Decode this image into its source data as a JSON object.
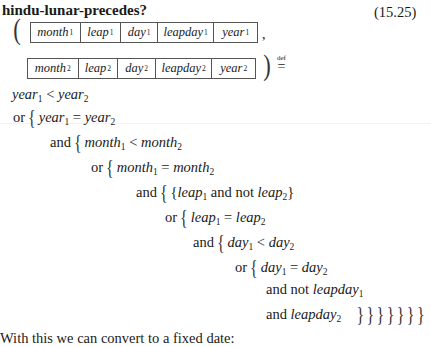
{
  "header": {
    "title": "hindu-lunar-precedes?",
    "equation_number": "(15.25)"
  },
  "signature": {
    "open_paren": "(",
    "close_paren": ")",
    "comma": ",",
    "def_label": "def",
    "def_symbol": "=",
    "record1": [
      {
        "name": "month",
        "sub": "1"
      },
      {
        "name": "leap",
        "sub": "1"
      },
      {
        "name": "day",
        "sub": "1"
      },
      {
        "name": "leapday",
        "sub": "1"
      },
      {
        "name": "year",
        "sub": "1"
      }
    ],
    "record2": [
      {
        "name": "month",
        "sub": "2"
      },
      {
        "name": "leap",
        "sub": "2"
      },
      {
        "name": "day",
        "sub": "2"
      },
      {
        "name": "leapday",
        "sub": "2"
      },
      {
        "name": "year",
        "sub": "2"
      }
    ]
  },
  "definition": {
    "lines": [
      {
        "kw": "",
        "lhs": "year",
        "lsub": "1",
        "op": "<",
        "rhs": "year",
        "rsub": "2"
      },
      {
        "kw": "or",
        "lhs": "year",
        "lsub": "1",
        "op": "=",
        "rhs": "year",
        "rsub": "2"
      },
      {
        "kw": "and",
        "lhs": "month",
        "lsub": "1",
        "op": "<",
        "rhs": "month",
        "rsub": "2"
      },
      {
        "kw": "or",
        "lhs": "month",
        "lsub": "1",
        "op": "=",
        "rhs": "month",
        "rsub": "2"
      },
      {
        "kw": "and",
        "lhs": "leap",
        "lsub": "1",
        "op": "and not",
        "rhs": "leap",
        "rsub": "2"
      },
      {
        "kw": "or",
        "lhs": "leap",
        "lsub": "1",
        "op": "=",
        "rhs": "leap",
        "rsub": "2"
      },
      {
        "kw": "and",
        "lhs": "day",
        "lsub": "1",
        "op": "<",
        "rhs": "day",
        "rsub": "2"
      },
      {
        "kw": "or",
        "lhs": "day",
        "lsub": "1",
        "op": "=",
        "rhs": "day",
        "rsub": "2"
      },
      {
        "kw": "and not",
        "lhs": "leapday",
        "lsub": "1"
      },
      {
        "kw": "and",
        "lhs": "leapday",
        "lsub": "2",
        "closing": "} } } } } } }"
      }
    ],
    "open_brace": "{",
    "close_brace": "}"
  },
  "body": {
    "text": "With this we can convert to a fixed date:"
  }
}
